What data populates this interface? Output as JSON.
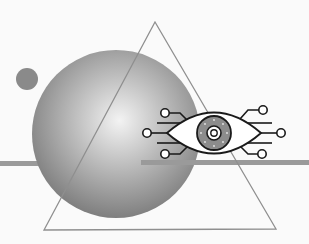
{
  "illustration": {
    "subject": "cyber eye surveillance concept",
    "elements": [
      "small-dot",
      "gradient-sphere",
      "triangle-outline",
      "horizontal-bars",
      "circuit-eye"
    ],
    "colors": {
      "background": "#fafafa",
      "sphere_light": "#f2f2f2",
      "sphere_dark": "#7a7a7a",
      "dot": "#8a8a8a",
      "bar": "#9a9a9a",
      "triangle": "#8f8f8f",
      "eye_outline": "#1a1a1a",
      "iris": "#8c8c8c"
    }
  }
}
